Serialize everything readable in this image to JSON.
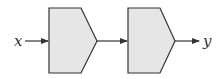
{
  "diagram": {
    "type": "block-diagram",
    "input_label": "x",
    "output_label": "y",
    "blocks": [
      {
        "id": "block-1",
        "shape": "pentagon-arrow"
      },
      {
        "id": "block-2",
        "shape": "pentagon-arrow"
      }
    ],
    "connections": [
      {
        "from": "x",
        "to": "block-1"
      },
      {
        "from": "block-1",
        "to": "block-2"
      },
      {
        "from": "block-2",
        "to": "y"
      }
    ],
    "colors": {
      "block_fill": "#e6e6e6",
      "stroke": "#333333"
    }
  }
}
